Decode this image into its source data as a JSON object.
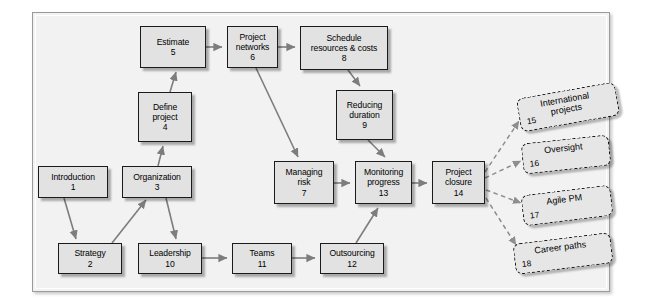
{
  "figure": {
    "background": "#f2f2f2",
    "node_fill": "#e2e2e2",
    "node_border": "#1b1b1b",
    "dashed_fill": "#e6e6e6",
    "connector_color": "#7d7d7d"
  },
  "nodes": [
    {
      "id": "n1",
      "label": "Introduction",
      "number": "1",
      "x": 38,
      "y": 166,
      "w": 70,
      "h": 32
    },
    {
      "id": "n2",
      "label": "Strategy",
      "number": "2",
      "x": 58,
      "y": 243,
      "w": 64,
      "h": 31
    },
    {
      "id": "n3",
      "label": "Organization",
      "number": "3",
      "x": 122,
      "y": 166,
      "w": 70,
      "h": 32
    },
    {
      "id": "n4",
      "label": "Define|project",
      "number": "4",
      "x": 138,
      "y": 92,
      "w": 54,
      "h": 50
    },
    {
      "id": "n5",
      "label": "Estimate",
      "number": "5",
      "x": 140,
      "y": 26,
      "w": 66,
      "h": 42
    },
    {
      "id": "n6",
      "label": "Project|networks",
      "number": "6",
      "x": 227,
      "y": 26,
      "w": 51,
      "h": 42
    },
    {
      "id": "n7",
      "label": "Managing|risk",
      "number": "7",
      "x": 274,
      "y": 161,
      "w": 60,
      "h": 43
    },
    {
      "id": "n8",
      "label": "Schedule|resources & costs",
      "number": "8",
      "x": 300,
      "y": 26,
      "w": 88,
      "h": 44
    },
    {
      "id": "n9",
      "label": "Reducing|duration",
      "number": "9",
      "x": 336,
      "y": 90,
      "w": 57,
      "h": 50
    },
    {
      "id": "n10",
      "label": "Leadership",
      "number": "10",
      "x": 138,
      "y": 243,
      "w": 64,
      "h": 31
    },
    {
      "id": "n11",
      "label": "Teams",
      "number": "11",
      "x": 232,
      "y": 243,
      "w": 60,
      "h": 31
    },
    {
      "id": "n12",
      "label": "Outsourcing",
      "number": "12",
      "x": 320,
      "y": 243,
      "w": 64,
      "h": 31
    },
    {
      "id": "n13",
      "label": "Monitoring|progress",
      "number": "13",
      "x": 355,
      "y": 161,
      "w": 57,
      "h": 43
    },
    {
      "id": "n14",
      "label": "Project|closure",
      "number": "14",
      "x": 432,
      "y": 161,
      "w": 53,
      "h": 43
    }
  ],
  "dashed_nodes": [
    {
      "id": "d15",
      "label": "International|projects",
      "number": "15",
      "x": 518,
      "y": 90,
      "w": 100,
      "h": 34,
      "rotate": -10
    },
    {
      "id": "d16",
      "label": "Oversight",
      "number": "16",
      "x": 522,
      "y": 139,
      "w": 88,
      "h": 31,
      "rotate": -6
    },
    {
      "id": "d17",
      "label": "Agile PM",
      "number": "17",
      "x": 522,
      "y": 190,
      "w": 90,
      "h": 31,
      "rotate": -7
    },
    {
      "id": "d18",
      "label": "Career paths",
      "number": "18",
      "x": 514,
      "y": 238,
      "w": 98,
      "h": 31,
      "rotate": -7
    }
  ],
  "connectors": [
    {
      "from": "n1",
      "to": "n2",
      "style": "solid"
    },
    {
      "from": "n2",
      "to": "n3",
      "style": "solid"
    },
    {
      "from": "n3",
      "to": "n4",
      "style": "solid"
    },
    {
      "from": "n3",
      "to": "n10",
      "style": "solid"
    },
    {
      "from": "n4",
      "to": "n5",
      "style": "solid"
    },
    {
      "from": "n5",
      "to": "n6",
      "style": "solid"
    },
    {
      "from": "n6",
      "to": "n8",
      "style": "solid"
    },
    {
      "from": "n6",
      "to": "n7",
      "style": "solid"
    },
    {
      "from": "n8",
      "to": "n9",
      "style": "solid"
    },
    {
      "from": "n9",
      "to": "n13",
      "style": "solid"
    },
    {
      "from": "n7",
      "to": "n13",
      "style": "solid"
    },
    {
      "from": "n10",
      "to": "n11",
      "style": "solid"
    },
    {
      "from": "n11",
      "to": "n12",
      "style": "solid"
    },
    {
      "from": "n12",
      "to": "n13",
      "style": "solid"
    },
    {
      "from": "n13",
      "to": "n14",
      "style": "solid"
    },
    {
      "from": "n14",
      "to": "d15",
      "style": "dashed"
    },
    {
      "from": "n14",
      "to": "d16",
      "style": "dashed"
    },
    {
      "from": "n14",
      "to": "d17",
      "style": "dashed"
    },
    {
      "from": "n14",
      "to": "d18",
      "style": "dashed"
    }
  ]
}
